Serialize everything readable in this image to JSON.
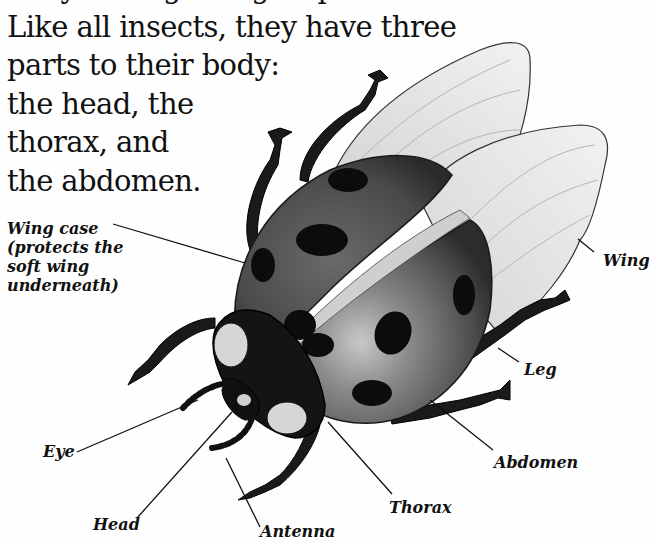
{
  "intro_text": {
    "clipped_line": "They belong to a group...",
    "lines": [
      "Like all insects, they have three",
      "parts to their body:",
      "the head, the",
      "thorax, and",
      "the abdomen."
    ]
  },
  "diagram": {
    "labels": {
      "wing_case": [
        "Wing case",
        "(protects the",
        "soft wing",
        "underneath)"
      ],
      "wing": "Wing",
      "leg": "Leg",
      "abdomen": "Abdomen",
      "thorax": "Thorax",
      "antenna": "Antenna",
      "head": "Head",
      "eye": "Eye"
    },
    "colors": {
      "ink": "#111111",
      "shell": "#4a4a4a",
      "shell_highlight": "#9a9a9a",
      "spot": "#0c0c0c",
      "wing": "#e6e6e6",
      "wing_vein": "#b5b5b5",
      "eye_patch": "#d6d6d6"
    }
  }
}
